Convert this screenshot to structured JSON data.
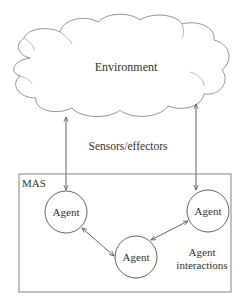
{
  "diagram": {
    "environment": {
      "label": "Environment"
    },
    "link_label": "Sensors/effectors",
    "mas": {
      "label": "MAS"
    },
    "agents": [
      {
        "label": "Agent"
      },
      {
        "label": "Agent"
      },
      {
        "label": "Agent"
      }
    ],
    "interactions_label_line1": "Agent",
    "interactions_label_line2": "interactions",
    "colors": {
      "stroke": "#555555",
      "text": "#333333",
      "background": "#ffffff"
    }
  }
}
